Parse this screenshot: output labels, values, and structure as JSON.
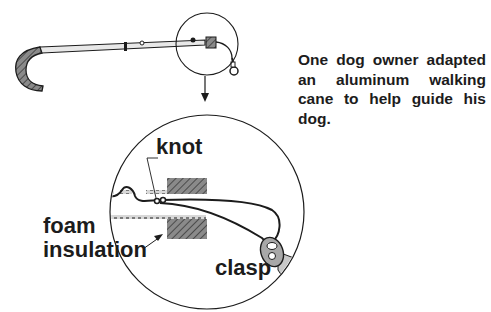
{
  "caption": "One dog owner adapted an aluminum walking cane to help guide his dog.",
  "labels": {
    "knot": "knot",
    "foam_line1": "foam",
    "foam_line2": "insulation",
    "clasp": "clasp"
  },
  "figure": {
    "parts": [
      "cane-handle",
      "cane-shaft",
      "foam-insulation",
      "knot",
      "cord",
      "clasp"
    ],
    "detail_view": "magnified cross-section of cane tip",
    "colors": {
      "ink": "#1c1c1c",
      "hatch": "#555555",
      "shaft": "#e6e6e6",
      "background": "#ffffff"
    }
  }
}
